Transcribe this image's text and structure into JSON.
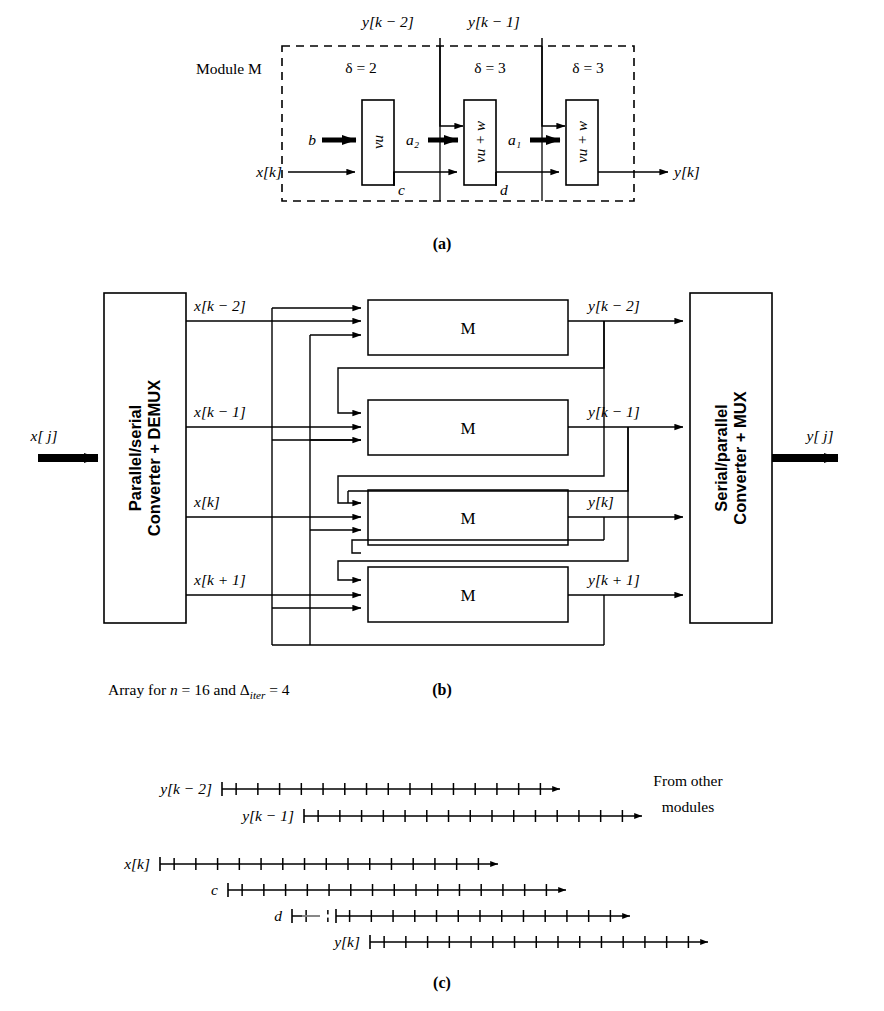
{
  "figure": {
    "panel_a": {
      "label": "(a)",
      "module_label": "Module M",
      "stage_delays": [
        "δ = 2",
        "δ = 3",
        "δ = 3"
      ],
      "top_inputs": [
        "y[k − 2]",
        "y[k − 1]"
      ],
      "left_inputs": [
        "b",
        "x[k]"
      ],
      "box_texts": [
        "vu",
        "vu + w",
        "vu + w"
      ],
      "intermediate_labels": [
        "a₂",
        "a₁"
      ],
      "bottom_labels": [
        "c",
        "d"
      ],
      "output": "y[k]"
    },
    "panel_b": {
      "label": "(b)",
      "caption": "Array for n = 16 and Δiter = 4",
      "caption_parts": {
        "prefix": "Array for ",
        "n_sym": "n",
        "mid": " = 16 and ",
        "delta_sym": "Δ",
        "delta_sub": "iter",
        "suffix": " = 4"
      },
      "demux_label": "Parallel/serial Converter + DEMUX",
      "demux_line1": "Parallel/serial",
      "demux_line2": "Converter + DEMUX",
      "mux_label": "Serial/parallel Converter + MUX",
      "mux_line1": "Serial/parallel",
      "mux_line2": "Converter + MUX",
      "global_input": "x[ j]",
      "global_output": "y[ j]",
      "input_taps": [
        "x[k − 2]",
        "x[k − 1]",
        "x[k]",
        "x[k + 1]"
      ],
      "output_taps": [
        "y[k − 2]",
        "y[k − 1]",
        "y[k]",
        "y[k + 1]"
      ],
      "module_label": "M",
      "module_count": 4
    },
    "panel_c": {
      "label": "(c)",
      "note_line1": "From other",
      "note_line2": "modules",
      "rows": [
        {
          "name": "y[k − 2]",
          "label_x": 212,
          "y": 789,
          "start": 222,
          "end": 560,
          "ticks": 15,
          "arrow": true,
          "dashed_head": false
        },
        {
          "name": "y[k − 1]",
          "label_x": 294,
          "y": 816,
          "start": 304,
          "end": 642,
          "ticks": 15,
          "arrow": true,
          "dashed_head": false
        },
        {
          "name": "x[k]",
          "label_x": 150,
          "y": 864,
          "start": 160,
          "end": 498,
          "ticks": 15,
          "arrow": true,
          "dashed_head": false
        },
        {
          "name": "c",
          "label_x": 218,
          "y": 890,
          "start": 228,
          "end": 566,
          "ticks": 15,
          "arrow": true,
          "dashed_head": false
        },
        {
          "name": "d",
          "label_x": 282,
          "y": 916,
          "start": 292,
          "end": 630,
          "ticks": 15,
          "arrow": true,
          "dashed_head": true
        },
        {
          "name": "y[k]",
          "label_x": 360,
          "y": 942,
          "start": 370,
          "end": 708,
          "ticks": 15,
          "arrow": true,
          "dashed_head": false
        }
      ]
    }
  },
  "style": {
    "stroke": "#000000",
    "background": "#ffffff"
  }
}
